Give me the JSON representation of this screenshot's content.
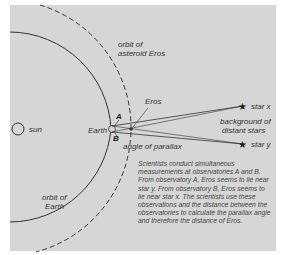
{
  "diagram": {
    "labels": {
      "sun": "sun",
      "earth": "Earth",
      "observatory_a": "A",
      "observatory_b": "B",
      "eros": "Eros",
      "orbit_eros_line1": "orbit of",
      "orbit_eros_line2": "asteroid Eros",
      "orbit_earth_line1": "orbit of",
      "orbit_earth_line2": "Earth",
      "angle_of_parallax": "angle of parallax",
      "star_x": "star x",
      "star_y": "star y",
      "background_line1": "background of",
      "background_line2": "distant stars"
    },
    "description": "Scientists conduct simultaneous measurements at observatories A and B. From observatory A, Eros seems to lie near star y. From observatory B, Eros seems to lie near star x. The scientists use these observations and the distance between the observatories to calculate the parallax angle and therefore the distance of Eros.",
    "colors": {
      "background": "#d6d6d6",
      "line": "#333333",
      "text": "#333333"
    }
  }
}
